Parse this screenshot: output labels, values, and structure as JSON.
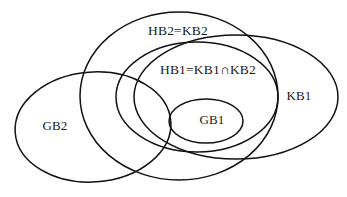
{
  "diagram": {
    "type": "euler-venn-diagram",
    "background_color": "#ffffff",
    "stroke_color": "#111111",
    "text_color": "#1a1a1a",
    "width": 347,
    "height": 197,
    "sets": [
      {
        "id": "gb2",
        "label": "GB2",
        "label_x": 55,
        "label_y": 127,
        "cx": 93,
        "cy": 127,
        "rx": 78,
        "ry": 55,
        "rotation": -4
      },
      {
        "id": "hb2kb2",
        "label": "HB2=KB2",
        "label_x": 178,
        "label_y": 32,
        "cx": 179,
        "cy": 96,
        "rx": 99,
        "ry": 84,
        "rotation": 0
      },
      {
        "id": "kb1",
        "label": "KB1",
        "label_x": 299,
        "label_y": 97,
        "cx": 236,
        "cy": 97,
        "rx": 102,
        "ry": 62,
        "rotation": 0
      },
      {
        "id": "hb1",
        "label": "HB1=KB1∩KB2",
        "label_x": 208,
        "label_y": 71,
        "cx": 197,
        "cy": 97,
        "rx": 81,
        "ry": 55,
        "rotation": 0
      },
      {
        "id": "gb1",
        "label": "GB1",
        "label_x": 212,
        "label_y": 121,
        "cx": 206,
        "cy": 121,
        "rx": 37,
        "ry": 22,
        "rotation": 0
      }
    ]
  }
}
